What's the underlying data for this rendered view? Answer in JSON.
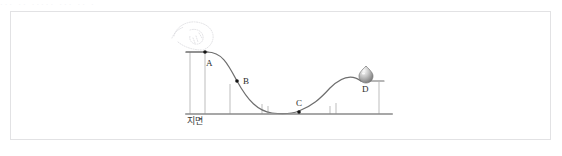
{
  "page": {
    "background_color": "#ffffff",
    "top_strip_text": "···  ··   ·····  ···  ·· ·",
    "width": 562,
    "height": 156
  },
  "figure": {
    "name": "energy-track-diagram",
    "border_color": "#e2e2e4",
    "background_color": "#ffffff",
    "ground_label": "지면",
    "ground_color": "#8a8a8a",
    "track_color": "#6e6e6e",
    "post_color": "#b9b9b9",
    "point_color": "#1a1a1a",
    "sketch_color": "#d9d9dd",
    "points": [
      {
        "id": "A",
        "label": "A",
        "x": 205,
        "y": 52,
        "label_x": 208,
        "label_y": 65
      },
      {
        "id": "B",
        "label": "B",
        "x": 237,
        "y": 81,
        "label_x": 243,
        "label_y": 81
      },
      {
        "id": "C",
        "label": "C",
        "x": 299,
        "y": 111,
        "label_x": 297,
        "label_y": 104
      },
      {
        "id": "D",
        "label": "D",
        "x": 366,
        "y": 80,
        "label_x": 363,
        "label_y": 90
      }
    ],
    "ball": {
      "name": "ball-at-d",
      "cx": 366,
      "cy": 74,
      "r": 6.5,
      "fill_light": "#f2f2f2",
      "fill_dark": "#8f8f8f",
      "stroke": "#6a6a6a"
    },
    "ground_line": {
      "x1": 186,
      "x2": 392,
      "y": 114
    },
    "posts": [
      {
        "name": "post-a-left",
        "x": 190,
        "y_top": 52,
        "y_bottom": 114
      },
      {
        "name": "post-a-right",
        "x": 205,
        "y_top": 52,
        "y_bottom": 114
      },
      {
        "name": "post-b-left",
        "x": 230,
        "y_top": 83,
        "y_bottom": 114
      },
      {
        "name": "post-c-left-outer",
        "x": 262,
        "y_top": 104,
        "y_bottom": 114
      },
      {
        "name": "post-c-left-inner",
        "x": 268,
        "y_top": 105,
        "y_bottom": 114
      },
      {
        "name": "post-c-right-inner",
        "x": 330,
        "y_top": 105,
        "y_bottom": 114
      },
      {
        "name": "post-c-right-outer",
        "x": 336,
        "y_top": 104,
        "y_bottom": 114
      },
      {
        "name": "post-d-right",
        "x": 379,
        "y_top": 81,
        "y_bottom": 114
      }
    ],
    "platforms": [
      {
        "name": "platform-a",
        "x1": 186,
        "x2": 208,
        "y": 52
      },
      {
        "name": "platform-d",
        "x1": 362,
        "x2": 383,
        "y": 81
      }
    ],
    "track_path": "M 186 52 L 207 52 C 222 52 228 64 237 81 C 248 101 258 111 272 113 C 288 115 294 113 299 111 C 312 106 320 99 330 88 C 342 76 352 74 362 81",
    "sketch_annotation": {
      "name": "hand-drawn-scribble",
      "description": "faint dotted sketch above point A",
      "paths": [
        "M 174 36 C 176 27 186 21 196 22 C 205 23 212 28 213 35 C 214 42 209 48 203 50",
        "M 178 42 C 184 47 193 50 202 50",
        "M 190 30 C 196 28 202 31 203 36 C 204 41 200 45 195 44 C 191 43 189 39 190 36",
        "M 196 36 L 198 42 M 193 38 L 195 43"
      ]
    }
  }
}
